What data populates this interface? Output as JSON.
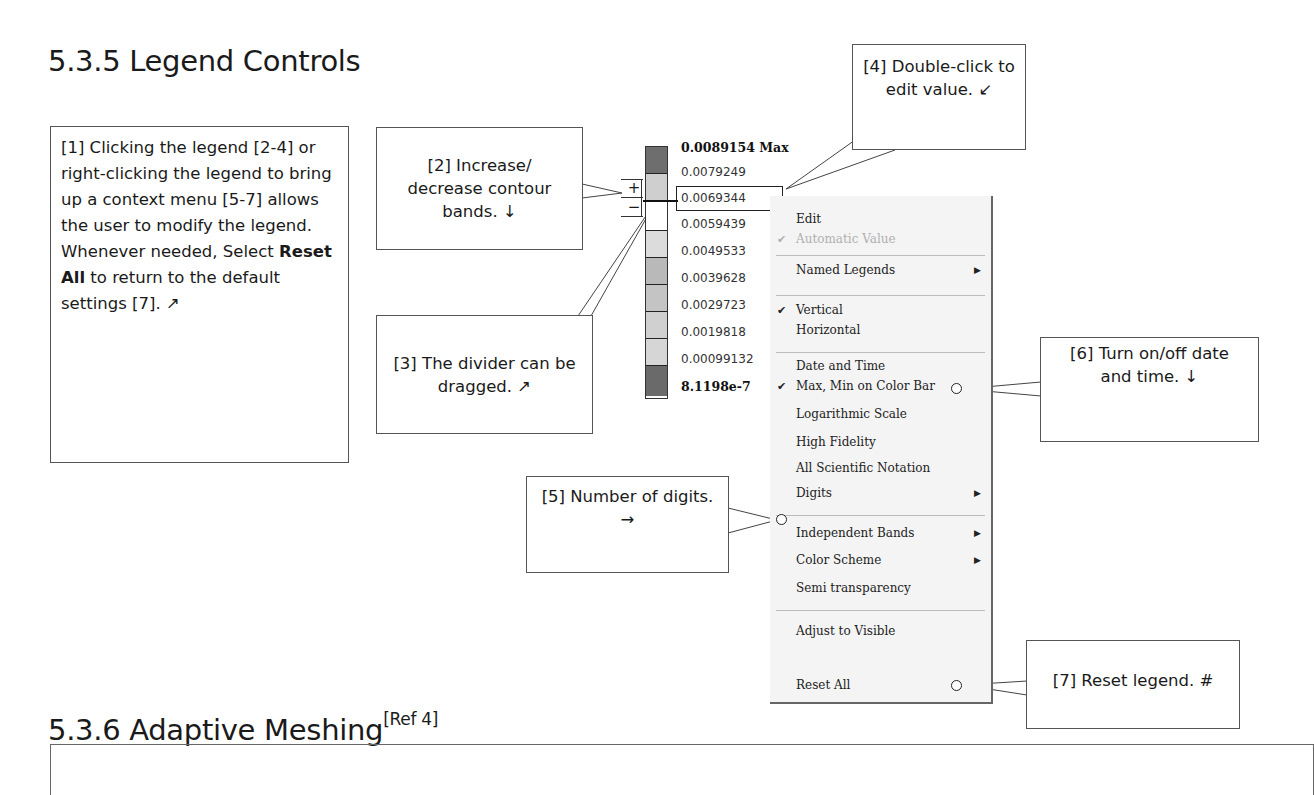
{
  "headings": {
    "section_535": "5.3.5  Legend Controls",
    "section_536": "5.3.6  Adaptive Meshing",
    "section_536_ref": "[Ref 4]"
  },
  "callouts": {
    "c1_part1": "[1] Clicking the legend [2-4] or right-clicking the legend to bring up a context menu [5-7] allows the user to modify the legend. Whenever needed, Select ",
    "c1_bold": "Reset All",
    "c1_part2": " to return to the default settings [7]. ↗",
    "c2": "[2] Increase/ decrease contour bands. ↓",
    "c3": "[3] The divider can be dragged. ↗",
    "c4": "[4] Double-click to edit value. ↙",
    "c5": "[5] Number of digits. →",
    "c6": "[6] Turn on/off date and time. ↓",
    "c7": "[7] Reset legend. #"
  },
  "legend": {
    "plus_label": "+",
    "minus_label": "−",
    "values": [
      {
        "text": "0.0089154 Max",
        "bold": true
      },
      {
        "text": "0.0079249"
      },
      {
        "text": "0.0069344",
        "editing": true
      },
      {
        "text": "0.0059439"
      },
      {
        "text": "0.0049533"
      },
      {
        "text": "0.0039628"
      },
      {
        "text": "0.0029723"
      },
      {
        "text": "0.0019818"
      },
      {
        "text": "0.00099132"
      },
      {
        "text": "8.1198e-7",
        "bold": true
      }
    ],
    "band_colors": [
      "#6e6e6e",
      "#cfcfcf",
      "#ffffff",
      "#dcdcdc",
      "#b9b9b9",
      "#c4c4c4",
      "#d0d0d0",
      "#d6d6d6",
      "#6a6a6a"
    ]
  },
  "context_menu": {
    "items": [
      {
        "label": "Edit",
        "checked": false,
        "disabled": false,
        "submenu": false
      },
      {
        "label": "Automatic Value",
        "checked": true,
        "disabled": true,
        "submenu": false
      },
      {
        "label": "Named Legends",
        "checked": false,
        "disabled": false,
        "submenu": true
      },
      {
        "label": "Vertical",
        "checked": true,
        "disabled": false,
        "submenu": false
      },
      {
        "label": "Horizontal",
        "checked": false,
        "disabled": false,
        "submenu": false
      },
      {
        "label": "Date and Time",
        "checked": false,
        "disabled": false,
        "submenu": false
      },
      {
        "label": "Max, Min on Color Bar",
        "checked": true,
        "disabled": false,
        "submenu": false
      },
      {
        "label": "Logarithmic Scale",
        "checked": false,
        "disabled": false,
        "submenu": false
      },
      {
        "label": "High Fidelity",
        "checked": false,
        "disabled": false,
        "submenu": false
      },
      {
        "label": "All Scientific Notation",
        "checked": false,
        "disabled": false,
        "submenu": false
      },
      {
        "label": "Digits",
        "checked": false,
        "disabled": false,
        "submenu": true
      },
      {
        "label": "Independent Bands",
        "checked": false,
        "disabled": false,
        "submenu": true
      },
      {
        "label": "Color Scheme",
        "checked": false,
        "disabled": false,
        "submenu": true
      },
      {
        "label": "Semi transparency",
        "checked": false,
        "disabled": false,
        "submenu": false
      },
      {
        "label": "Adjust to Visible",
        "checked": false,
        "disabled": false,
        "submenu": false
      },
      {
        "label": "Reset All",
        "checked": false,
        "disabled": false,
        "submenu": false
      }
    ],
    "check_glyph": "✔",
    "arrow_glyph": "▶"
  }
}
